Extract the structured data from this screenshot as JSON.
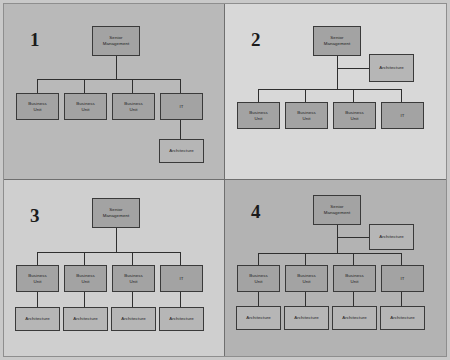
{
  "figure": {
    "colors": {
      "box_fill": "#a3a3a3",
      "box_fill_light": "#b6b6b6",
      "box_border": "#3a3a3a",
      "connector": "#2f2f2f",
      "panel_1_background": "#b9b9b9",
      "panel_2_background": "#d8d8d8",
      "panel_3_background": "#cfcfcf",
      "panel_4_background": "#b3b3b3",
      "divider": "#6f6f6f",
      "number_color": "#1b1b1b"
    }
  },
  "labels": {
    "senior_management": "Senior\nManagement",
    "senior_management_line1": "Senior",
    "senior_management_line2": "Management",
    "business_unit_line1": "Business",
    "business_unit_line2": "Unit",
    "it": "IT",
    "architecture": "Architecture"
  },
  "quadrants": [
    {
      "number": "1",
      "nodes": {
        "top": "Senior Management",
        "unit1_line1": "Business",
        "unit1_line2": "Unit",
        "unit2_line1": "Business",
        "unit2_line2": "Unit",
        "unit3_line1": "Business",
        "unit3_line2": "Unit",
        "it": "IT",
        "architecture": "Architecture"
      }
    },
    {
      "number": "2",
      "nodes": {
        "top": "Senior Management",
        "staff_architecture": "Architecture",
        "unit1_line1": "Business",
        "unit1_line2": "Unit",
        "unit2_line1": "Business",
        "unit2_line2": "Unit",
        "unit3_line1": "Business",
        "unit3_line2": "Unit",
        "it": "IT"
      }
    },
    {
      "number": "3",
      "nodes": {
        "top": "Senior Management",
        "unit1_line1": "Business",
        "unit1_line2": "Unit",
        "unit2_line1": "Business",
        "unit2_line2": "Unit",
        "unit3_line1": "Business",
        "unit3_line2": "Unit",
        "it": "IT",
        "architecture1": "Architecture",
        "architecture2": "Architecture",
        "architecture3": "Architecture",
        "architecture4": "Architecture"
      }
    },
    {
      "number": "4",
      "nodes": {
        "top": "Senior Management",
        "staff_architecture": "Architecture",
        "unit1_line1": "Business",
        "unit1_line2": "Unit",
        "unit2_line1": "Business",
        "unit2_line2": "Unit",
        "unit3_line1": "Business",
        "unit3_line2": "Unit",
        "it": "IT",
        "architecture1": "Architecture",
        "architecture2": "Architecture",
        "architecture3": "Architecture",
        "architecture4": "Architecture"
      }
    }
  ]
}
